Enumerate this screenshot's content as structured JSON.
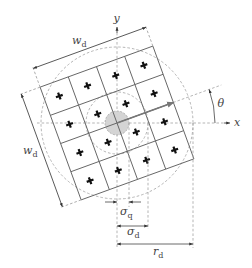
{
  "figure": {
    "axes": {
      "x_label": "x",
      "y_label": "y"
    },
    "angle_label": "θ",
    "width_labels": {
      "top": {
        "main": "w",
        "sub": "d"
      },
      "left": {
        "main": "w",
        "sub": "d"
      }
    },
    "radius_labels": {
      "sigma_q": {
        "main": "σ",
        "sub": "q"
      },
      "sigma_d": {
        "main": "σ",
        "sub": "d"
      },
      "r_d": {
        "main": "r",
        "sub": "d"
      }
    },
    "grid": {
      "rows": 4,
      "cols": 4
    },
    "markers": {
      "symbol": "+",
      "count": 16
    },
    "colors": {
      "grid": "#666666",
      "dashed": "#a2a2a2",
      "center_disk": "#d4d4d4",
      "direction_arrow": "#777777",
      "marker": "#111111"
    }
  }
}
